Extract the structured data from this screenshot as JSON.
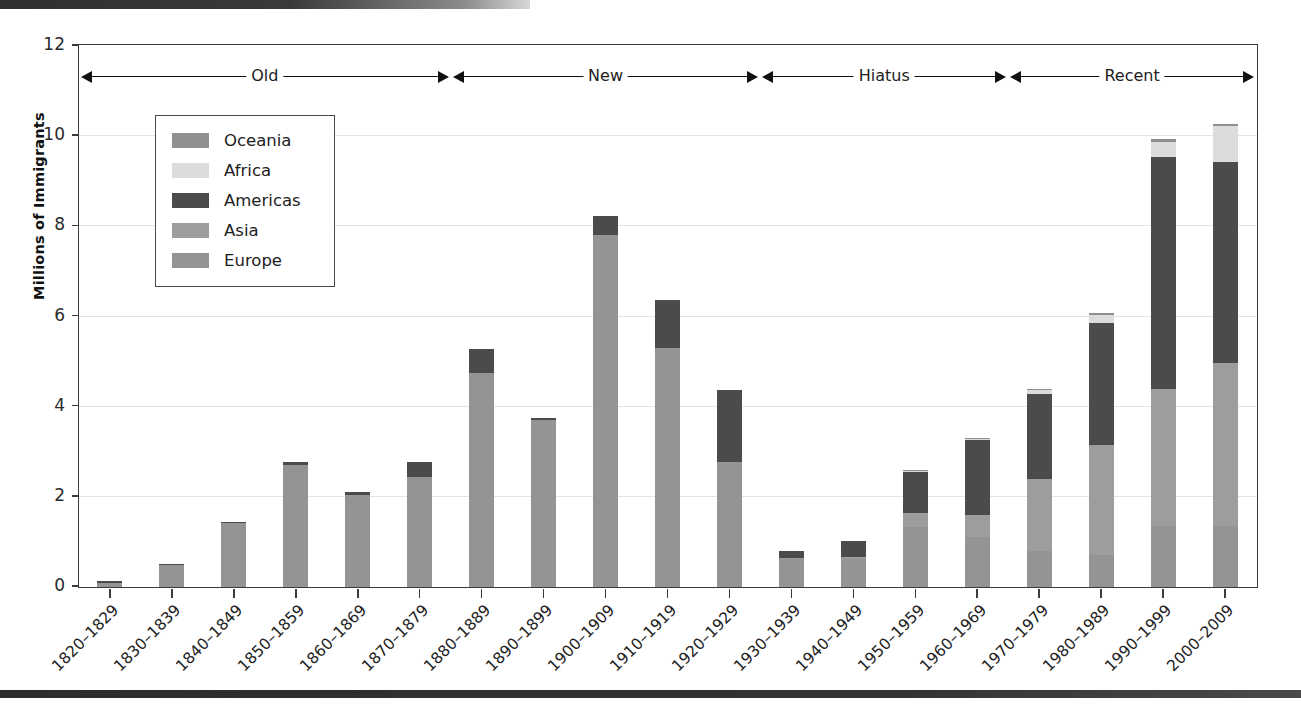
{
  "figure": {
    "y_axis_title": "Millions of Immigrants",
    "y_ticks": [
      "0",
      "2",
      "4",
      "6",
      "8",
      "10",
      "12"
    ]
  },
  "legend": {
    "items": [
      {
        "label": "Oceania",
        "color": "#8f8f8f"
      },
      {
        "label": "Africa",
        "color": "#dcdcdc"
      },
      {
        "label": "Americas",
        "color": "#4b4b4b"
      },
      {
        "label": "Asia",
        "color": "#9d9d9d"
      },
      {
        "label": "Europe",
        "color": "#949494"
      }
    ]
  },
  "eras": [
    {
      "label": "Old",
      "start_index": 0,
      "end_index": 5
    },
    {
      "label": "New",
      "start_index": 6,
      "end_index": 10
    },
    {
      "label": "Hiatus",
      "start_index": 11,
      "end_index": 14
    },
    {
      "label": "Recent",
      "start_index": 15,
      "end_index": 18
    }
  ],
  "chart_data": {
    "type": "bar",
    "title": "",
    "subtitle": "",
    "xlabel": "",
    "ylabel": "Millions of Immigrants",
    "ylim": [
      0,
      12
    ],
    "grid": true,
    "stacked": true,
    "legend_position": "inside-top-left",
    "categories": [
      "1820–1829",
      "1830–1839",
      "1840–1849",
      "1850–1859",
      "1860–1869",
      "1870–1879",
      "1880–1889",
      "1890–1899",
      "1900–1909",
      "1910–1919",
      "1920–1929",
      "1930–1939",
      "1940–1949",
      "1950–1959",
      "1960–1969",
      "1970–1979",
      "1980–1989",
      "1990–1999",
      "2000–2009"
    ],
    "series": [
      {
        "name": "Europe",
        "color": "#949494",
        "values": [
          0.1,
          0.5,
          1.42,
          2.7,
          2.03,
          2.45,
          4.74,
          3.7,
          7.8,
          5.3,
          2.78,
          0.62,
          0.62,
          1.33,
          1.12,
          0.8,
          0.7,
          1.35,
          1.35
        ]
      },
      {
        "name": "Asia",
        "color": "#9d9d9d",
        "values": [
          0.0,
          0.0,
          0.0,
          0.0,
          0.0,
          0.0,
          0.0,
          0.0,
          0.0,
          0.0,
          0.0,
          0.02,
          0.04,
          0.32,
          0.47,
          1.59,
          2.46,
          3.05,
          3.63
        ]
      },
      {
        "name": "Americas",
        "color": "#4b4b4b",
        "values": [
          0.03,
          0.02,
          0.03,
          0.08,
          0.08,
          0.32,
          0.53,
          0.04,
          0.43,
          1.06,
          1.6,
          0.16,
          0.35,
          0.92,
          1.67,
          1.9,
          2.7,
          5.13,
          4.44
        ]
      },
      {
        "name": "Africa",
        "color": "#dcdcdc",
        "values": [
          0.0,
          0.0,
          0.0,
          0.0,
          0.0,
          0.0,
          0.0,
          0.0,
          0.0,
          0.0,
          0.0,
          0.0,
          0.0,
          0.01,
          0.03,
          0.08,
          0.18,
          0.35,
          0.8
        ]
      },
      {
        "name": "Oceania",
        "color": "#8f8f8f",
        "values": [
          0.0,
          0.0,
          0.0,
          0.0,
          0.0,
          0.0,
          0.0,
          0.0,
          0.0,
          0.0,
          0.0,
          0.0,
          0.0,
          0.01,
          0.01,
          0.02,
          0.04,
          0.06,
          0.06
        ]
      }
    ],
    "totals": [
      0.13,
      0.52,
      1.45,
      2.78,
      2.11,
      2.77,
      5.27,
      3.74,
      8.23,
      6.36,
      4.38,
      0.8,
      1.01,
      2.59,
      3.3,
      4.39,
      6.08,
      9.94,
      10.28
    ]
  }
}
